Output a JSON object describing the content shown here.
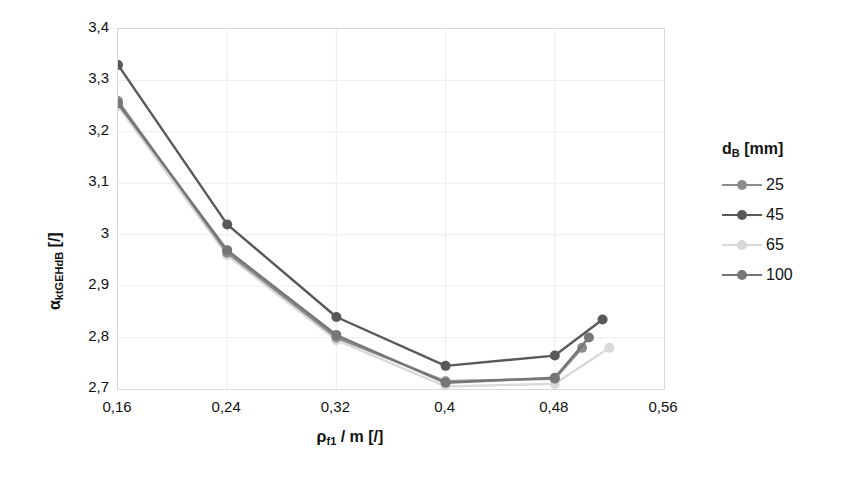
{
  "chart_data": {
    "type": "line",
    "title": "",
    "xlabel": "ρ_f1 / m [/]",
    "ylabel": "α_ktGEHdB [/]",
    "xlim": [
      0.16,
      0.56
    ],
    "ylim": [
      2.7,
      3.4
    ],
    "grid": true,
    "legend_position": "right",
    "legend_title": "d_B [mm]",
    "xticks": [
      "0,16",
      "0,24",
      "0,32",
      "0,4",
      "0,48",
      "0,56"
    ],
    "xtick_values": [
      0.16,
      0.24,
      0.32,
      0.4,
      0.48,
      0.56
    ],
    "yticks": [
      "3,4",
      "3,3",
      "3,2",
      "3,1",
      "3",
      "2,9",
      "2,8",
      "2,7"
    ],
    "ytick_values": [
      3.4,
      3.3,
      3.2,
      3.1,
      3.0,
      2.9,
      2.8,
      2.7
    ],
    "series": [
      {
        "name": "25",
        "color": "#8c8c8c",
        "x": [
          0.16,
          0.24,
          0.32,
          0.4,
          0.48,
          0.5
        ],
        "values": [
          3.26,
          2.965,
          2.8,
          2.715,
          2.72,
          2.78
        ]
      },
      {
        "name": "45",
        "color": "#595959",
        "x": [
          0.16,
          0.24,
          0.32,
          0.4,
          0.48,
          0.515
        ],
        "values": [
          3.33,
          3.02,
          2.84,
          2.745,
          2.765,
          2.835
        ]
      },
      {
        "name": "65",
        "color": "#d9d9d9",
        "x": [
          0.16,
          0.24,
          0.32,
          0.4,
          0.48,
          0.52
        ],
        "values": [
          3.25,
          2.96,
          2.795,
          2.705,
          2.71,
          2.78
        ]
      },
      {
        "name": "100",
        "color": "#767676",
        "x": [
          0.16,
          0.24,
          0.32,
          0.4,
          0.48,
          0.505
        ],
        "values": [
          3.255,
          2.97,
          2.805,
          2.712,
          2.722,
          2.8
        ]
      }
    ]
  },
  "axes": {
    "y_title_main": "α",
    "y_title_sub": "ktGEHdB",
    "y_title_unit": " [/]",
    "x_title_main": "ρ",
    "x_title_sub": "f1",
    "x_title_unit": " / m [/]"
  },
  "legend": {
    "title_main": "d",
    "title_sub": "B",
    "title_unit": " [mm]",
    "items": [
      {
        "label": "25",
        "color": "#8c8c8c"
      },
      {
        "label": "45",
        "color": "#595959"
      },
      {
        "label": "65",
        "color": "#d9d9d9"
      },
      {
        "label": "100",
        "color": "#767676"
      }
    ]
  },
  "style": {
    "plot_border": "#d9d9d9",
    "gridline": "#ededed",
    "text": "#111111"
  }
}
